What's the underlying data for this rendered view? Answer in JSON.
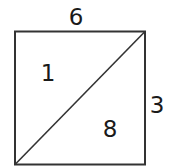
{
  "diagram": {
    "shape": "square divided by diagonal",
    "top_label": "6",
    "right_label": "3",
    "upper_triangle_label": "1",
    "lower_triangle_label": "8",
    "stroke_color": "#333333"
  }
}
